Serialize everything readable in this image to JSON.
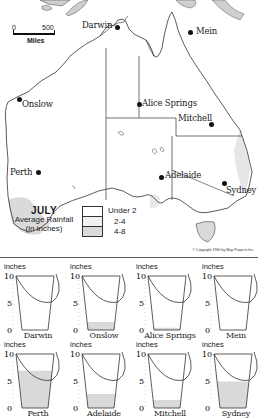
{
  "map": {
    "title": "JULY",
    "subtitle": "Average Rainfall",
    "unit_note": "(in inches)",
    "scale": {
      "start": "0",
      "end": "500",
      "unit": "Miles"
    },
    "copyright": "© Copyright 1960 by Map Projects Inc.",
    "legend": [
      {
        "label": "Under 2",
        "color": "#ffffff"
      },
      {
        "label": "2-4",
        "color": "#f1f1f1"
      },
      {
        "label": "4-8",
        "color": "#dadada"
      }
    ],
    "cities": [
      {
        "name": "Darwin"
      },
      {
        "name": "Mein"
      },
      {
        "name": "Onslow"
      },
      {
        "name": "Alice Springs"
      },
      {
        "name": "Mitchell"
      },
      {
        "name": "Perth"
      },
      {
        "name": "Adelaide"
      },
      {
        "name": "Sydney"
      }
    ]
  },
  "buckets": {
    "unit_label": "inches",
    "ticks": [
      "10",
      "5",
      "0"
    ]
  },
  "chart_data": {
    "type": "bar",
    "title": "JULY Average Rainfall (in inches)",
    "xlabel": "",
    "ylabel": "inches",
    "ylim": [
      0,
      10
    ],
    "yticks": [
      0,
      5,
      10
    ],
    "categories": [
      "Darwin",
      "Onslow",
      "Alice Springs",
      "Mein",
      "Perth",
      "Adelaide",
      "Mitchell",
      "Sydney"
    ],
    "values": [
      0.0,
      1.5,
      0.4,
      0.0,
      6.9,
      2.6,
      1.5,
      4.9
    ],
    "fill_color": "#d9d9d9",
    "note": "Each value shown as water level in a bucket pictogram"
  }
}
